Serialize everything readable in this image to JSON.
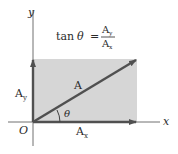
{
  "diagram": {
    "formula": {
      "lhs_func": "tan",
      "lhs_var": "θ",
      "equals": "=",
      "numerator": "A",
      "numerator_sub": "y",
      "denominator": "A",
      "denominator_sub": "x"
    },
    "axes": {
      "x_label": "x",
      "y_label": "y",
      "origin_label": "O"
    },
    "vector": {
      "label": "A",
      "angle_label": "θ"
    },
    "components": {
      "x": {
        "label": "A",
        "sub": "x"
      },
      "y": {
        "label": "A",
        "sub": "y"
      }
    },
    "colors": {
      "rect_fill": "#d6d6d6",
      "vector": "#505050",
      "axis": "#606060",
      "text": "#2a2a2a"
    }
  }
}
